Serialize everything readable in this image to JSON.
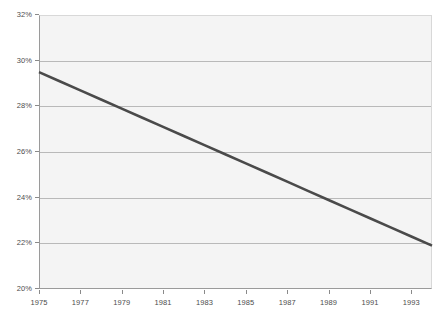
{
  "chart_data": {
    "type": "line",
    "title": "",
    "subtitle": "",
    "xlabel": "",
    "ylabel": "",
    "legend": [],
    "legend_position": "none",
    "grid": true,
    "grid_axis": "y",
    "xlim": [
      1975,
      1994
    ],
    "ylim": [
      20,
      32
    ],
    "ytick_labels": [
      "32%",
      "30%",
      "28%",
      "26%",
      "24%",
      "22%",
      "20%"
    ],
    "ytick_values": [
      32,
      30,
      28,
      26,
      24,
      22,
      20
    ],
    "xtick_labels": [
      "1975",
      "1977",
      "1979",
      "1981",
      "1983",
      "1985",
      "1987",
      "1989",
      "1991",
      "1993"
    ],
    "xtick_values": [
      1975,
      1977,
      1979,
      1981,
      1983,
      1985,
      1987,
      1989,
      1991,
      1993
    ],
    "series": [
      {
        "name": "",
        "color": "#4a4a4a",
        "x": [
          1975,
          1976,
          1977,
          1978,
          1979,
          1980,
          1981,
          1982,
          1983,
          1984,
          1985,
          1986,
          1987,
          1988,
          1989,
          1990,
          1991,
          1992,
          1993,
          1994
        ],
        "values": [
          29.5,
          29.1,
          28.7,
          28.3,
          27.9,
          27.5,
          27.1,
          26.7,
          26.3,
          25.9,
          25.5,
          25.1,
          24.7,
          24.3,
          23.9,
          23.5,
          23.1,
          22.7,
          22.3,
          21.9
        ]
      }
    ]
  },
  "colors": {
    "line": "#4a4a4a",
    "plot_background": "#f4f4f4",
    "gridline": "#b9b9b9",
    "axis": "#9a9a9a",
    "tick_text": "#4d4d4d",
    "page_background": "#ffffff"
  }
}
